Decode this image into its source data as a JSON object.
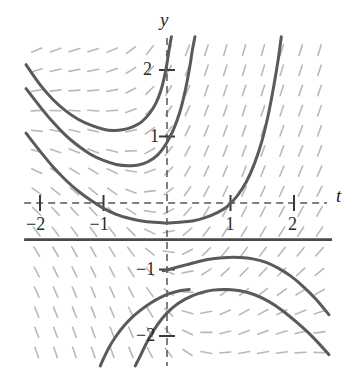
{
  "figure": {
    "kind": "slope-field-with-solution-curves",
    "background_color": "#ffffff"
  },
  "axes": {
    "x_axis_label": "t",
    "y_axis_label": "y",
    "axis_style": "dashed",
    "axis_color": "#555555",
    "x_ticks": [
      {
        "value": -2,
        "label": "−2"
      },
      {
        "value": -1,
        "label": "−1"
      },
      {
        "value": 1,
        "label": "1"
      },
      {
        "value": 2,
        "label": "2"
      }
    ],
    "y_ticks": [
      {
        "value": 2,
        "label": "2"
      },
      {
        "value": 1,
        "label": "1"
      },
      {
        "value": -1,
        "label": "−1"
      },
      {
        "value": -2,
        "label": "−2"
      }
    ]
  },
  "chart_data": {
    "type": "line",
    "title": "",
    "xlabel": "t",
    "ylabel": "y",
    "xlim": [
      -2.25,
      2.6
    ],
    "ylim": [
      -2.45,
      2.5
    ],
    "grid": false,
    "legend": "none",
    "slope_field": {
      "color": "#b9b9b9",
      "dash_length": 11,
      "x_range": [
        -2.2,
        2.55
      ],
      "y_range": [
        -2.4,
        2.45
      ],
      "columns": 16,
      "rows": 16,
      "description": "short dashed tangent segments indicating dy/dt at each grid point"
    },
    "equilibrium_line": {
      "y": -0.55,
      "color": "#4a4a4a",
      "style": "solid",
      "x_from": -2.25,
      "x_to": 2.6
    },
    "series": [
      {
        "name": "curve-upper-1",
        "color": "#5a5a5a",
        "points": [
          [
            -2.22,
            2.08
          ],
          [
            -2.0,
            1.78
          ],
          [
            -1.8,
            1.56
          ],
          [
            -1.6,
            1.39
          ],
          [
            -1.4,
            1.26
          ],
          [
            -1.2,
            1.17
          ],
          [
            -1.0,
            1.11
          ],
          [
            -0.85,
            1.09
          ],
          [
            -0.7,
            1.1
          ],
          [
            -0.55,
            1.14
          ],
          [
            -0.4,
            1.22
          ],
          [
            -0.28,
            1.34
          ],
          [
            -0.18,
            1.49
          ],
          [
            -0.1,
            1.68
          ],
          [
            -0.04,
            1.9
          ],
          [
            0.0,
            2.1
          ],
          [
            0.04,
            2.35
          ],
          [
            0.07,
            2.5
          ]
        ]
      },
      {
        "name": "curve-upper-2",
        "color": "#5a5a5a",
        "points": [
          [
            -2.22,
            1.72
          ],
          [
            -2.0,
            1.45
          ],
          [
            -1.8,
            1.22
          ],
          [
            -1.6,
            1.02
          ],
          [
            -1.4,
            0.86
          ],
          [
            -1.2,
            0.73
          ],
          [
            -1.0,
            0.64
          ],
          [
            -0.8,
            0.58
          ],
          [
            -0.6,
            0.56
          ],
          [
            -0.45,
            0.57
          ],
          [
            -0.3,
            0.62
          ],
          [
            -0.15,
            0.72
          ],
          [
            -0.02,
            0.88
          ],
          [
            0.1,
            1.1
          ],
          [
            0.2,
            1.36
          ],
          [
            0.28,
            1.66
          ],
          [
            0.35,
            2.0
          ],
          [
            0.4,
            2.3
          ],
          [
            0.44,
            2.5
          ]
        ]
      },
      {
        "name": "curve-upper-3",
        "color": "#5a5a5a",
        "points": [
          [
            -2.22,
            1.05
          ],
          [
            -2.0,
            0.78
          ],
          [
            -1.8,
            0.55
          ],
          [
            -1.6,
            0.35
          ],
          [
            -1.4,
            0.18
          ],
          [
            -1.2,
            0.04
          ],
          [
            -1.0,
            -0.08
          ],
          [
            -0.8,
            -0.17
          ],
          [
            -0.6,
            -0.23
          ],
          [
            -0.4,
            -0.27
          ],
          [
            -0.2,
            -0.29
          ],
          [
            0.0,
            -0.3
          ],
          [
            0.2,
            -0.29
          ],
          [
            0.4,
            -0.27
          ],
          [
            0.6,
            -0.22
          ],
          [
            0.8,
            -0.14
          ],
          [
            0.95,
            -0.05
          ],
          [
            1.1,
            0.1
          ],
          [
            1.25,
            0.32
          ],
          [
            1.38,
            0.6
          ],
          [
            1.5,
            0.95
          ],
          [
            1.6,
            1.35
          ],
          [
            1.68,
            1.75
          ],
          [
            1.75,
            2.15
          ],
          [
            1.8,
            2.5
          ]
        ]
      },
      {
        "name": "curve-lower-1",
        "color": "#5a5a5a",
        "points": [
          [
            -0.06,
            -1.02
          ],
          [
            0.1,
            -0.98
          ],
          [
            0.3,
            -0.93
          ],
          [
            0.5,
            -0.88
          ],
          [
            0.72,
            -0.84
          ],
          [
            0.95,
            -0.82
          ],
          [
            1.15,
            -0.82
          ],
          [
            1.35,
            -0.84
          ],
          [
            1.55,
            -0.89
          ],
          [
            1.75,
            -0.98
          ],
          [
            1.95,
            -1.1
          ],
          [
            2.15,
            -1.26
          ],
          [
            2.35,
            -1.45
          ],
          [
            2.55,
            -1.68
          ]
        ]
      },
      {
        "name": "curve-lower-2",
        "color": "#5a5a5a",
        "points": [
          [
            -0.5,
            -2.45
          ],
          [
            -0.42,
            -2.3
          ],
          [
            -0.33,
            -2.12
          ],
          [
            -0.22,
            -1.93
          ],
          [
            -0.08,
            -1.74
          ],
          [
            0.08,
            -1.58
          ],
          [
            0.28,
            -1.45
          ],
          [
            0.5,
            -1.36
          ],
          [
            0.72,
            -1.31
          ],
          [
            0.95,
            -1.3
          ],
          [
            1.15,
            -1.32
          ],
          [
            1.38,
            -1.38
          ],
          [
            1.6,
            -1.48
          ],
          [
            1.82,
            -1.62
          ],
          [
            2.05,
            -1.8
          ],
          [
            2.3,
            -2.02
          ],
          [
            2.55,
            -2.28
          ]
        ]
      },
      {
        "name": "curve-lower-3",
        "color": "#5a5a5a",
        "points": [
          [
            -1.05,
            -2.45
          ],
          [
            -0.98,
            -2.3
          ],
          [
            -0.9,
            -2.15
          ],
          [
            -0.8,
            -2.0
          ],
          [
            -0.68,
            -1.85
          ],
          [
            -0.55,
            -1.72
          ],
          [
            -0.4,
            -1.6
          ],
          [
            -0.25,
            -1.5
          ],
          [
            -0.1,
            -1.42
          ],
          [
            0.05,
            -1.36
          ],
          [
            0.2,
            -1.32
          ],
          [
            0.35,
            -1.3
          ]
        ]
      }
    ]
  }
}
